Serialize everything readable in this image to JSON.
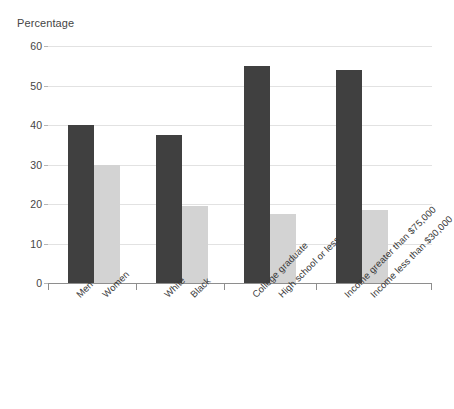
{
  "chart_data": {
    "type": "bar",
    "title": "",
    "ylabel": "Percentage",
    "xlabel": "",
    "ylim": [
      0,
      60
    ],
    "ytick_values": [
      0,
      10,
      20,
      30,
      40,
      50,
      60
    ],
    "ytick_labels": [
      "0",
      "10",
      "20",
      "30",
      "40",
      "50",
      "60"
    ],
    "grid": true,
    "legend": "none",
    "categories": [
      "Men",
      "Women",
      "White",
      "Black",
      "College graduate",
      "High school or less",
      "Income greater than $75,000",
      "Income less than $30,000"
    ],
    "values": [
      40,
      30,
      37.5,
      19.5,
      55,
      17.5,
      54,
      18.5
    ],
    "bar_colors": [
      "#404040",
      "#d3d3d3",
      "#404040",
      "#d3d3d3",
      "#404040",
      "#d3d3d3",
      "#404040",
      "#d3d3d3"
    ],
    "groups": [
      {
        "label": "Gender",
        "categories": [
          "Men",
          "Women"
        ]
      },
      {
        "label": "Race",
        "categories": [
          "White",
          "Black"
        ]
      },
      {
        "label": "Education",
        "categories": [
          "College graduate",
          "High school or less"
        ]
      },
      {
        "label": "Income",
        "categories": [
          "Income greater than $75,000",
          "Income less than $30,000"
        ]
      }
    ]
  },
  "colors": {
    "dark_bar": "#404040",
    "light_bar": "#d3d3d3",
    "gridline": "#e2e2e2",
    "axis": "#8e8e8e",
    "text": "#3a3a3a",
    "background": "#ffffff"
  }
}
